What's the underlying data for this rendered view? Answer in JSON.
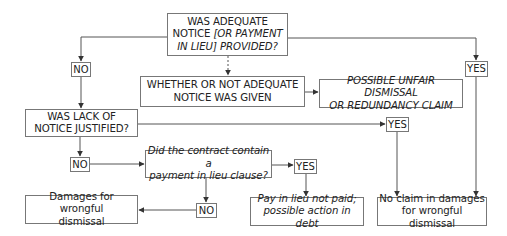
{
  "nodes": {
    "q_notice": {
      "line1": "WAS ADEQUATE",
      "line2a": "NOTICE ",
      "line2b": "[OR PAYMENT",
      "line3a": "IN LIEU]",
      "line3b": " PROVIDED?"
    },
    "whether": {
      "line1": "WHETHER OR NOT ADEQUATE",
      "line2": "NOTICE WAS GIVEN"
    },
    "possible": {
      "line1": "POSSIBLE UNFAIR DISMISSAL",
      "line2": "OR REDUNDANCY CLAIM"
    },
    "q_justified": {
      "line1": "WAS LACK OF",
      "line2": "NOTICE JUSTIFIED?"
    },
    "q_pilon": {
      "line1": "Did the contract contain a",
      "line2": "payment in lieu clause?"
    },
    "damages": {
      "line1": "Damages for wrongful",
      "line2": "dismissal"
    },
    "pay_in_lieu": {
      "line1": "Pay in lieu not paid;",
      "line2": "possible action in debt"
    },
    "no_claim": {
      "line1": "No claim in damages",
      "line2": "for wrongful dismissal"
    }
  },
  "labels": {
    "no_1": "NO",
    "yes_1": "YES",
    "yes_2": "YES",
    "no_2": "NO",
    "yes_3": "YES",
    "no_3": "NO"
  },
  "colors": {
    "line": "#555555",
    "border": "#777777"
  }
}
